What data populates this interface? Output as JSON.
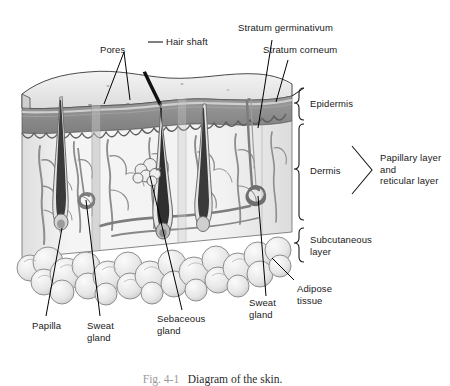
{
  "figure": {
    "caption_number": "Fig. 4-1",
    "caption_text": "Diagram of the skin.",
    "background_color": "#ffffff",
    "line_color": "#000000"
  },
  "callouts": {
    "pores": "Pores",
    "hair_shaft": "Hair shaft",
    "stratum_germinativum": "Stratum germinativum",
    "stratum_corneum": "Stratum corneum",
    "papilla": "Papilla",
    "sweat_gland_left": "Sweat\ngland",
    "sebaceous_gland": "Sebaceous\ngland",
    "sweat_gland_right": "Sweat\ngland",
    "adipose_tissue": "Adipose\ntissue"
  },
  "brackets": {
    "epidermis": "Epidermis",
    "dermis": "Dermis",
    "subcutaneous": "Subcutaneous\nlayer",
    "dermis_sublayers": "Papillary layer\nand\nreticular layer"
  },
  "palette": {
    "epidermis_band": "#8a8a8a",
    "stratum_corneum": "#c9c9c9",
    "dermis_fill": "#f0f0f0",
    "dermis_side": "#d8d8d8",
    "top_surface": "#ededed",
    "adipose": "#e8e8e8",
    "vessel": "#8d8d8d",
    "hair": "#2a2a2a"
  }
}
